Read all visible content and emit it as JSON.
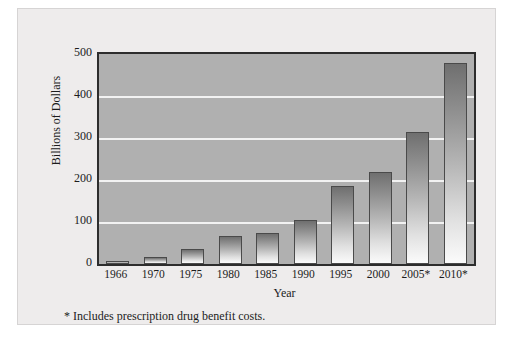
{
  "figure": {
    "footnote": "* Includes prescription drug benefit costs."
  },
  "chart_data": {
    "type": "bar",
    "title": "",
    "xlabel": "Year",
    "ylabel": "Billions of Dollars",
    "categories": [
      "1966",
      "1970",
      "1975",
      "1980",
      "1985",
      "1990",
      "1995",
      "2000",
      "2005*",
      "2010*"
    ],
    "values": [
      7,
      17,
      36,
      67,
      74,
      105,
      186,
      219,
      315,
      478
    ],
    "ylim": [
      0,
      500
    ],
    "yticks": [
      0,
      100,
      200,
      300,
      400,
      500
    ],
    "ytick_labels": [
      "0",
      "100",
      "200",
      "300",
      "400",
      "500"
    ],
    "grid": "horizontal-only",
    "legend": "none",
    "colors": {
      "plot_background": "#b0b0b0",
      "gridline": "#f2f2f2",
      "bar_top": "#6f6f6f",
      "bar_bottom": "#fbfbfb",
      "bar_border": "#4a4a4a",
      "axis_border": "#2d2d2d",
      "frame_background": "#eeecec",
      "text": "#1c1c1c"
    }
  }
}
